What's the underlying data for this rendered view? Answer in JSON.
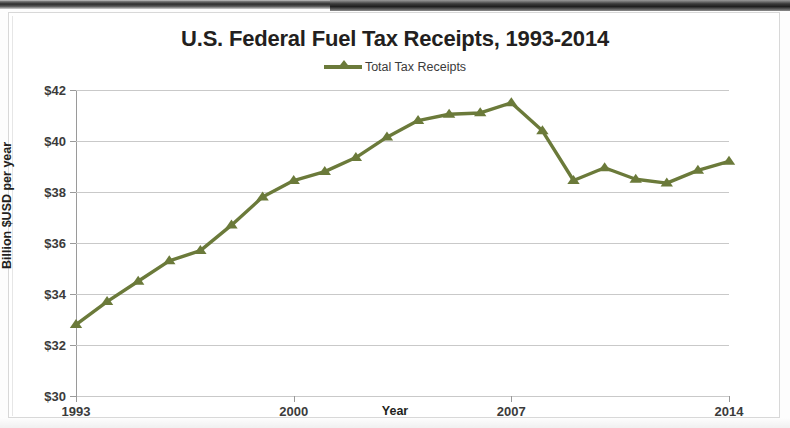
{
  "chart_data": {
    "type": "line",
    "title": "U.S. Federal Fuel Tax Receipts, 1993-2014",
    "xlabel": "Year",
    "ylabel": "Billion $USD per year",
    "grid": true,
    "legend_position": "top-center",
    "xlim": [
      1993,
      2014
    ],
    "ylim": [
      30,
      42
    ],
    "ytick_values": [
      30,
      32,
      34,
      36,
      38,
      40,
      42
    ],
    "ytick_labels": [
      "$30",
      "$32",
      "$34",
      "$36",
      "$38",
      "$40",
      "$42"
    ],
    "xtick_values": [
      1993,
      2000,
      2007,
      2014
    ],
    "xtick_labels": [
      "1993",
      "2000",
      "2007",
      "2014"
    ],
    "series": [
      {
        "name": "Total Tax Receipts",
        "color": "#6B7A3A",
        "marker": "triangle",
        "x": [
          1993,
          1994,
          1995,
          1996,
          1997,
          1998,
          1999,
          2000,
          2001,
          2002,
          2003,
          2004,
          2005,
          2006,
          2007,
          2008,
          2009,
          2010,
          2011,
          2012,
          2013,
          2014
        ],
        "values": [
          32.8,
          33.7,
          34.5,
          35.3,
          35.7,
          36.7,
          37.8,
          38.45,
          38.8,
          39.35,
          40.15,
          40.8,
          41.05,
          41.1,
          41.5,
          40.4,
          38.45,
          38.95,
          38.5,
          38.35,
          38.85,
          39.2
        ]
      }
    ]
  },
  "legend": {
    "entries": [
      {
        "label": "Total Tax Receipts",
        "color": "#6B7A3A"
      }
    ]
  }
}
